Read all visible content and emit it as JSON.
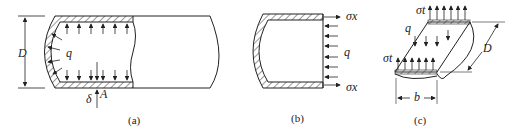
{
  "figure": {
    "panels": [
      {
        "id": "a",
        "caption": "(a)",
        "labels": {
          "diameter": "D",
          "pressure": "q",
          "thickness": "δ",
          "point": "A"
        }
      },
      {
        "id": "b",
        "caption": "(b)",
        "labels": {
          "stress_top": "σx",
          "stress_bottom": "σx",
          "pressure": "q"
        }
      },
      {
        "id": "c",
        "caption": "(c)",
        "labels": {
          "stress_top": "σt",
          "stress_left": "σt",
          "pressure": "q",
          "diameter": "D",
          "width": "b"
        }
      }
    ],
    "colors": {
      "line": "#222222",
      "background": "#ffffff"
    }
  }
}
